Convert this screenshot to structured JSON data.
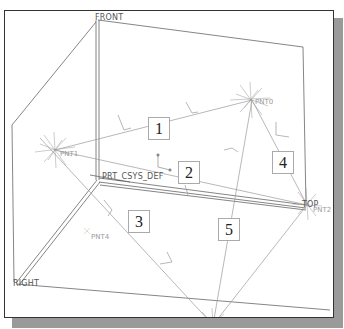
{
  "view": {
    "type": "3D sketch viewport (datum planes, points, coordinate system)",
    "colors": {
      "frame_border": "#333333",
      "shadow": "#9a9a9a",
      "plane_lines": "#666666",
      "feature_lines": "#9a9a9a",
      "background": "#ffffff"
    }
  },
  "datum_planes": [
    {
      "id": "front",
      "label": "FRONT"
    },
    {
      "id": "right",
      "label": "RIGHT"
    },
    {
      "id": "top",
      "label": "TOP"
    }
  ],
  "coordinate_system": {
    "label": "PRT_CSYS_DEF"
  },
  "datum_points": [
    {
      "id": "pnt0",
      "label": "PNT0"
    },
    {
      "id": "pnt1",
      "label": "PNT1"
    },
    {
      "id": "pnt2",
      "label": "PNT2"
    },
    {
      "id": "pnt3",
      "label": "PNT3"
    },
    {
      "id": "pnt4",
      "label": "PNT4"
    }
  ],
  "callouts": [
    {
      "id": "c1",
      "label": "1"
    },
    {
      "id": "c2",
      "label": "2"
    },
    {
      "id": "c3",
      "label": "3"
    },
    {
      "id": "c4",
      "label": "4"
    },
    {
      "id": "c5",
      "label": "5"
    }
  ]
}
